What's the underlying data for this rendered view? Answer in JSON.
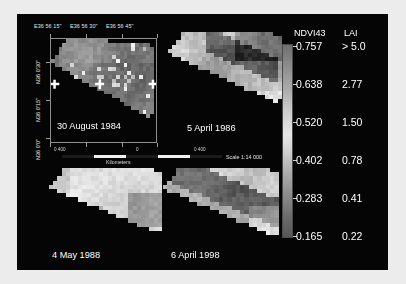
{
  "figure": {
    "background_color": "#ececec",
    "canvas_color": "#050505",
    "text_color": "#ffffff"
  },
  "axes": {
    "x_ticks": [
      "E36 56 15\"",
      "E36 56 30\"",
      "E36 56 45\""
    ],
    "y_ticks": [
      "N36 0'30\"",
      "N36 0'15\"",
      "N36 0'0\""
    ]
  },
  "scalebar": {
    "labels": [
      "0 400",
      "0",
      "0 400"
    ],
    "units": "Kilometers",
    "ratio": "Scale 1:14 000"
  },
  "legend": {
    "header_ndvi": "NDVI43",
    "header_lai": "LAI",
    "rows": [
      {
        "ndvi": "0.757",
        "lai": "> 5.0"
      },
      {
        "ndvi": "0.638",
        "lai": "2.77"
      },
      {
        "ndvi": "0.520",
        "lai": "1.50"
      },
      {
        "ndvi": "0.402",
        "lai": "0.78"
      },
      {
        "ndvi": "0.283",
        "lai": "0.41"
      },
      {
        "ndvi": "0.165",
        "lai": "0.22"
      }
    ],
    "colorbar_type": "grayscale"
  },
  "panels": [
    {
      "date": "30 August 1984",
      "id": "aug1984"
    },
    {
      "date": "5 April 1986",
      "id": "apr1986"
    },
    {
      "date": "4 May 1988",
      "id": "may1988"
    },
    {
      "date": "6 April 1998",
      "id": "apr1998"
    }
  ],
  "chart_data": {
    "type": "heatmap",
    "title": "",
    "legend_variable": "NDVI43",
    "secondary_variable": "LAI",
    "colormap": "grayscale",
    "colorbar_ticks_ndvi": [
      0.757,
      0.638,
      0.52,
      0.402,
      0.283,
      0.165
    ],
    "colorbar_ticks_lai": [
      5.0,
      2.77,
      1.5,
      0.78,
      0.41,
      0.22
    ],
    "vmin": 0.165,
    "vmax": 0.757,
    "panels": [
      {
        "label": "30 August 1984",
        "mean_ndvi": 0.42,
        "brightness": 0.42
      },
      {
        "label": "5 April 1986",
        "mean_ndvi": 0.6,
        "brightness": 0.66
      },
      {
        "label": "4 May 1988",
        "mean_ndvi": 0.71,
        "brightness": 0.84
      },
      {
        "label": "6 April 1998",
        "mean_ndvi": 0.36,
        "brightness": 0.36
      }
    ],
    "xlabel": "Longitude",
    "ylabel": "Latitude",
    "x_range": [
      "E36 56 15\"",
      "E36 56 45\""
    ],
    "y_range": [
      "N36 0'0\"",
      "N36 0'30\""
    ],
    "grid": false,
    "legend_position": "right"
  }
}
